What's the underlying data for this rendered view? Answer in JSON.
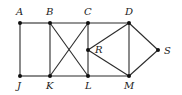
{
  "diagram": {
    "type": "graph",
    "nodes": [
      {
        "id": "A",
        "label": "A",
        "x": 20,
        "y": 23,
        "lx": 16,
        "ly": 15
      },
      {
        "id": "B",
        "label": "B",
        "x": 50,
        "y": 23,
        "lx": 46,
        "ly": 15
      },
      {
        "id": "C",
        "label": "C",
        "x": 88,
        "y": 23,
        "lx": 84,
        "ly": 15
      },
      {
        "id": "D",
        "label": "D",
        "x": 129,
        "y": 23,
        "lx": 125,
        "ly": 15
      },
      {
        "id": "R",
        "label": "R",
        "x": 88,
        "y": 50,
        "lx": 95,
        "ly": 53
      },
      {
        "id": "S",
        "label": "S",
        "x": 158,
        "y": 50,
        "lx": 164,
        "ly": 54
      },
      {
        "id": "J",
        "label": "J",
        "x": 20,
        "y": 76,
        "lx": 17,
        "ly": 89
      },
      {
        "id": "K",
        "label": "K",
        "x": 50,
        "y": 76,
        "lx": 46,
        "ly": 89
      },
      {
        "id": "L",
        "label": "L",
        "x": 88,
        "y": 76,
        "lx": 85,
        "ly": 89
      },
      {
        "id": "M",
        "label": "M",
        "x": 129,
        "y": 76,
        "lx": 124,
        "ly": 89
      }
    ],
    "edges": [
      [
        "A",
        "B"
      ],
      [
        "B",
        "C"
      ],
      [
        "C",
        "D"
      ],
      [
        "J",
        "K"
      ],
      [
        "K",
        "L"
      ],
      [
        "L",
        "M"
      ],
      [
        "A",
        "J"
      ],
      [
        "B",
        "K"
      ],
      [
        "C",
        "R"
      ],
      [
        "R",
        "L"
      ],
      [
        "B",
        "L"
      ],
      [
        "K",
        "C"
      ],
      [
        "R",
        "D"
      ],
      [
        "R",
        "M"
      ],
      [
        "D",
        "M"
      ],
      [
        "D",
        "S"
      ],
      [
        "M",
        "S"
      ]
    ],
    "colors": {
      "edge": "#2b2b2b",
      "node": "#111111",
      "label": "#222222",
      "background": "#ffffff"
    }
  }
}
